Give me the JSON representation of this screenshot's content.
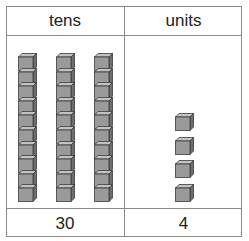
{
  "table": {
    "headers": [
      {
        "label": "tens"
      },
      {
        "label": "units"
      }
    ],
    "values": [
      {
        "label": "30"
      },
      {
        "label": "4"
      }
    ]
  },
  "blocks": {
    "tens_rods": 3,
    "cubes_per_rod": 10,
    "unit_cubes": 4,
    "colors": {
      "front": "#9a9a9a",
      "top": "#c2c2c2",
      "side": "#6e6e6e",
      "edge": "#3a3a3a"
    }
  }
}
